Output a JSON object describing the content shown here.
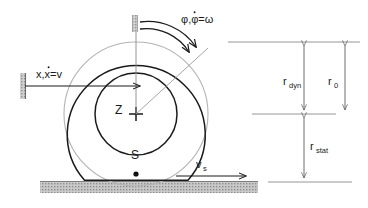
{
  "figure": {
    "background_color": "#ffffff",
    "line_color": "#1a1a1a",
    "light_line_color": "#9a9a9a",
    "hatch_color": "#a8a8a8"
  },
  "labels": {
    "translation": {
      "base": "x,",
      "dot_var": "x",
      "equals": "=v",
      "full": "x,ẋ=v"
    },
    "rotation": {
      "phi": "φ,",
      "phi_dot": "φ",
      "equals": "=ω",
      "full": "φ,φ̇=ω"
    },
    "center_point": "Z",
    "contact_region": "S",
    "slip_velocity": {
      "base": "v",
      "sub": "s"
    },
    "radius_dynamic": {
      "base": "r",
      "sub": "dyn"
    },
    "radius_nominal": {
      "base": "r",
      "sub": "0"
    },
    "radius_static": {
      "base": "r",
      "sub": "stat"
    }
  },
  "geometry": {
    "wheel_center_x": 136,
    "wheel_center_y": 114,
    "outer_circle_radius": 72,
    "tyre_circle_radius": 69,
    "rim_circle_radius": 41,
    "ground_y": 182,
    "ground_height": 11
  },
  "dimension_lines": {
    "top_y": 42,
    "middle_y": 114,
    "bottom_y": 182,
    "r_dyn_x": 304,
    "r_0_x": 345
  }
}
